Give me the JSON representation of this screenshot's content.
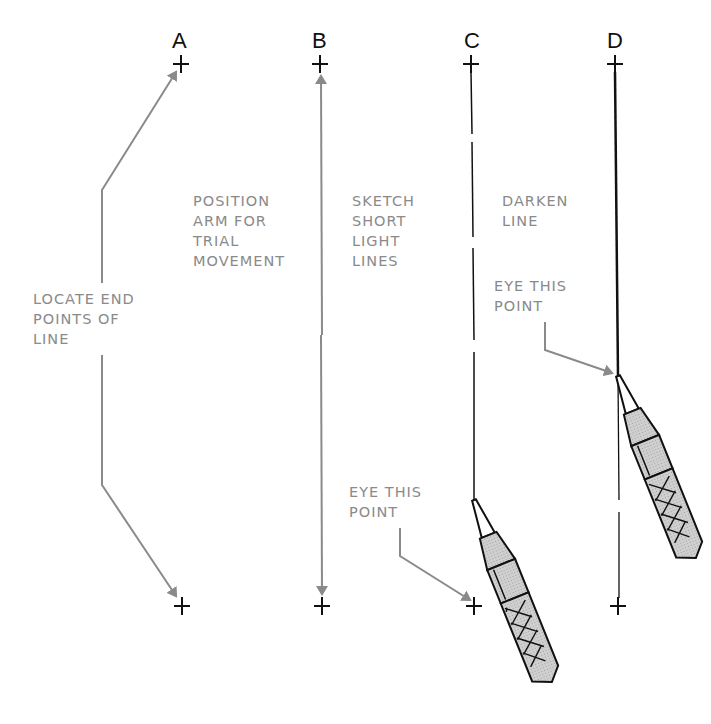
{
  "columns": {
    "a": {
      "label": "A",
      "note": "LOCATE END\nPOINTS OF\nLINE"
    },
    "b": {
      "label": "B",
      "note": "POSITION\nARM FOR\nTRIAL\nMOVEMENT"
    },
    "c": {
      "label": "C",
      "note": "SKETCH\nSHORT\nLIGHT\nLINES",
      "eye_note": "EYE THIS\nPOINT"
    },
    "d": {
      "label": "D",
      "note": "DARKEN\nLINE",
      "eye_note": "EYE THIS\nPOINT"
    }
  },
  "colors": {
    "ink": "#111111",
    "annotation": "#8a8a8a",
    "pencil_fill": "#c8c8c8"
  }
}
